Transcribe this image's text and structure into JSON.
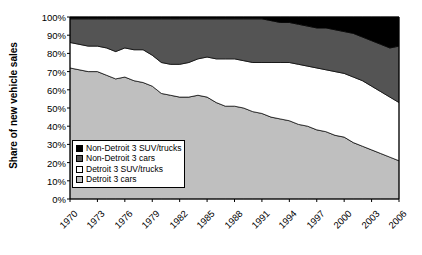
{
  "chart": {
    "type": "stacked-area",
    "ylabel": "Share of new vehicle sales",
    "ytick_labels": [
      "100%",
      "90%",
      "80%",
      "70%",
      "60%",
      "50%",
      "40%",
      "30%",
      "20%",
      "10%",
      "0%"
    ],
    "xtick_labels": [
      "1970",
      "1973",
      "1976",
      "1979",
      "1982",
      "1985",
      "1988",
      "1991",
      "1994",
      "1997",
      "2000",
      "2003",
      "2006"
    ],
    "legend": {
      "items": [
        {
          "label": "Non-Detroit 3 SUV/trucks",
          "color": "#000000"
        },
        {
          "label": "Non-Detroit 3 cars",
          "color": "#545454"
        },
        {
          "label": "Detroit 3 SUV/trucks",
          "color": "#ffffff"
        },
        {
          "label": "Detroit 3 cars",
          "color": "#bfbfbf"
        }
      ]
    }
  },
  "chart_data": {
    "type": "area",
    "title": "",
    "subtitle": "",
    "xlabel": "",
    "ylabel": "Share of new vehicle sales",
    "xlim": [
      1970,
      2006
    ],
    "ylim": [
      0,
      100
    ],
    "grid": false,
    "legend_position": "inside-lower-left",
    "stacked": true,
    "stack_order_bottom_to_top": [
      "Detroit 3 cars",
      "Detroit 3 SUV/trucks",
      "Non-Detroit 3 cars",
      "Non-Detroit 3 SUV/trucks"
    ],
    "x": [
      1970,
      1971,
      1972,
      1973,
      1974,
      1975,
      1976,
      1977,
      1978,
      1979,
      1980,
      1981,
      1982,
      1983,
      1984,
      1985,
      1986,
      1987,
      1988,
      1989,
      1990,
      1991,
      1992,
      1993,
      1994,
      1995,
      1996,
      1997,
      1998,
      1999,
      2000,
      2001,
      2002,
      2003,
      2004,
      2005,
      2006
    ],
    "x_tick_values": [
      1970,
      1973,
      1976,
      1979,
      1982,
      1985,
      1988,
      1991,
      1994,
      1997,
      2000,
      2003,
      2006
    ],
    "y_tick_values": [
      0,
      10,
      20,
      30,
      40,
      50,
      60,
      70,
      80,
      90,
      100
    ],
    "colors": {
      "Detroit 3 cars": "#bfbfbf",
      "Detroit 3 SUV/trucks": "#ffffff",
      "Non-Detroit 3 cars": "#545454",
      "Non-Detroit 3 SUV/trucks": "#000000"
    },
    "series": [
      {
        "name": "Detroit 3 cars",
        "values": [
          72,
          71,
          70,
          70,
          68,
          66,
          67,
          65,
          64,
          62,
          58,
          57,
          56,
          56,
          57,
          56,
          53,
          51,
          51,
          50,
          48,
          47,
          45,
          44,
          43,
          41,
          40,
          38,
          37,
          35,
          34,
          31,
          29,
          27,
          25,
          23,
          21
        ]
      },
      {
        "name": "Detroit 3 SUV/trucks",
        "values": [
          14,
          14,
          14,
          14,
          15,
          15,
          16,
          17,
          18,
          17,
          17,
          17,
          18,
          19,
          20,
          22,
          24,
          26,
          26,
          26,
          27,
          28,
          30,
          31,
          32,
          33,
          33,
          34,
          34,
          35,
          35,
          36,
          36,
          35,
          34,
          33,
          32
        ]
      },
      {
        "name": "Non-Detroit 3 cars",
        "values": [
          13,
          14,
          15,
          15,
          16,
          18,
          16,
          17,
          17,
          20,
          24,
          25,
          25,
          24,
          22,
          21,
          22,
          22,
          22,
          23,
          24,
          24,
          23,
          22,
          22,
          22,
          22,
          22,
          23,
          23,
          23,
          24,
          24,
          25,
          26,
          27,
          31
        ]
      },
      {
        "name": "Non-Detroit 3 SUV/trucks",
        "values": [
          1,
          1,
          1,
          1,
          1,
          1,
          1,
          1,
          1,
          1,
          1,
          1,
          1,
          1,
          1,
          1,
          1,
          1,
          1,
          1,
          1,
          1,
          2,
          3,
          3,
          4,
          5,
          6,
          6,
          7,
          8,
          9,
          11,
          13,
          15,
          17,
          16
        ]
      }
    ],
    "cumulative_tops": {
      "Detroit 3 cars": [
        72,
        71,
        70,
        70,
        68,
        66,
        67,
        65,
        64,
        62,
        58,
        57,
        56,
        56,
        57,
        56,
        53,
        51,
        51,
        50,
        48,
        47,
        45,
        44,
        43,
        41,
        40,
        38,
        37,
        35,
        34,
        31,
        29,
        27,
        25,
        23,
        21
      ],
      "Detroit 3 SUV/trucks": [
        86,
        85,
        84,
        84,
        83,
        81,
        83,
        82,
        82,
        79,
        75,
        74,
        74,
        75,
        77,
        78,
        77,
        77,
        77,
        76,
        75,
        75,
        75,
        75,
        75,
        74,
        73,
        72,
        71,
        70,
        69,
        67,
        65,
        62,
        59,
        56,
        53
      ],
      "Non-Detroit 3 cars": [
        99,
        99,
        99,
        99,
        99,
        99,
        99,
        99,
        99,
        99,
        99,
        99,
        99,
        99,
        99,
        99,
        99,
        99,
        99,
        99,
        99,
        99,
        98,
        97,
        97,
        96,
        95,
        94,
        94,
        93,
        92,
        91,
        89,
        87,
        85,
        83,
        84
      ],
      "Non-Detroit 3 SUV/trucks": [
        100,
        100,
        100,
        100,
        100,
        100,
        100,
        100,
        100,
        100,
        100,
        100,
        100,
        100,
        100,
        100,
        100,
        100,
        100,
        100,
        100,
        100,
        100,
        100,
        100,
        100,
        100,
        100,
        100,
        100,
        100,
        100,
        100,
        100,
        100,
        100,
        100
      ]
    }
  }
}
